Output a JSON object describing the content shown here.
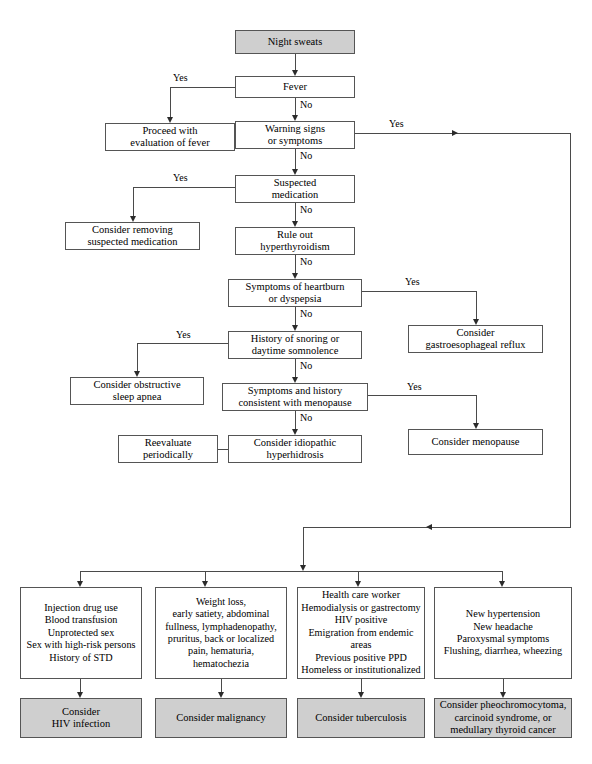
{
  "diagram": {
    "accent_shaded": "#cfcfcf",
    "line_color": "#4a4a4a"
  },
  "nodes": {
    "night_sweats": "Night sweats",
    "fever": "Fever",
    "proceed_fever": "Proceed with\nevaluation of fever",
    "warning_signs": "Warning signs\nor symptoms",
    "suspected_medication": "Suspected\nmedication",
    "consider_removing": "Consider removing\nsuspected medication",
    "rule_out_hyper": "Rule out\nhyperthyroidism",
    "heartburn": "Symptoms of heartburn\nor dyspepsia",
    "gerd": "Consider\ngastroesophageal reflux",
    "snoring": "History of snoring or\ndaytime somnolence",
    "sleep_apnea": "Consider obstructive\nsleep apnea",
    "menopause_q": "Symptoms and history\nconsistent with menopause",
    "consider_menopause": "Consider menopause",
    "idiopathic": "Consider idiopathic\nhyperhidrosis",
    "reevaluate": "Reevaluate\nperiodically",
    "risk_hiv": "Injection drug use\nBlood transfusion\nUnprotected sex\nSex with high-risk persons\nHistory of STD",
    "risk_malignancy": "Weight loss,\nearly satiety, abdominal\nfullness, lymphadenopathy,\npruritus, back or localized\npain, hematuria,\nhematochezia",
    "risk_tb": "Health care worker\nHemodialysis or gastrectomy\nHIV positive\nEmigration from endemic\nareas\nPrevious positive PPD\nHomeless or institutionalized",
    "risk_endocrine": "New hypertension\nNew headache\nParoxysmal symptoms\nFlushing, diarrhea, wheezing",
    "dx_hiv": "Consider\nHIV infection",
    "dx_malignancy": "Consider malignancy",
    "dx_tb": "Consider tuberculosis",
    "dx_endocrine": "Consider pheochromocytoma,\ncarcinoid syndrome, or\nmedullary thyroid cancer"
  },
  "edge_labels": {
    "fever_yes": "Yes",
    "fever_no": "No",
    "warning_yes": "Yes",
    "warning_no": "No",
    "medication_yes": "Yes",
    "medication_no": "No",
    "hyper_no": "No",
    "heartburn_yes": "Yes",
    "heartburn_no": "No",
    "snoring_yes": "Yes",
    "snoring_no": "No",
    "menopause_yes": "Yes",
    "menopause_no": "No"
  }
}
